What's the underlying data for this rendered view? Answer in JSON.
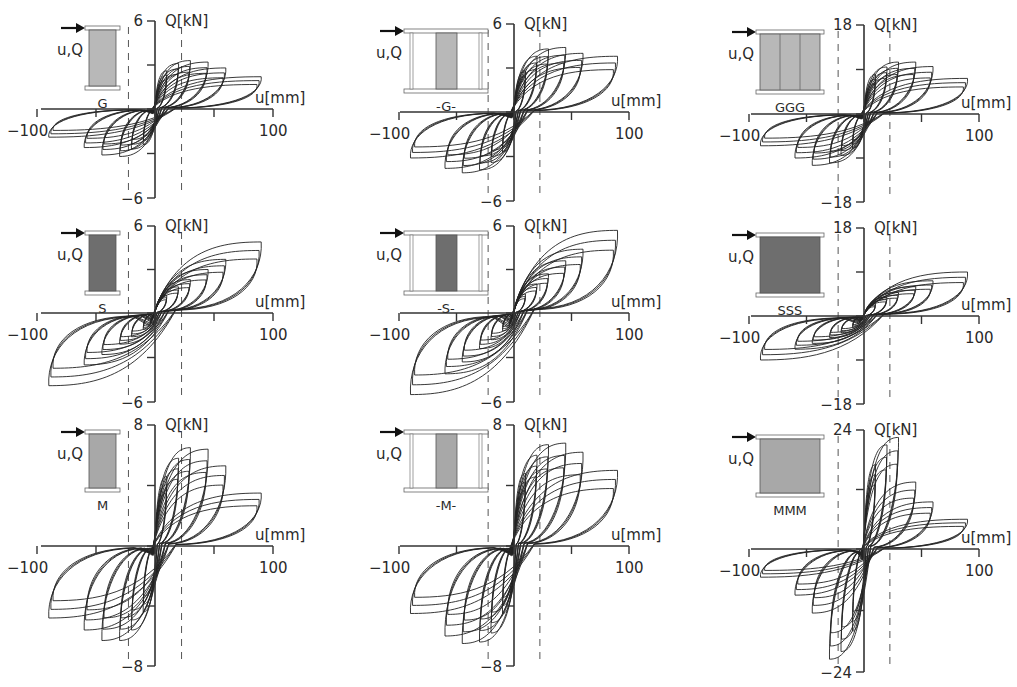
{
  "figure": {
    "caption": "",
    "axis_x_label": "u[mm]",
    "axis_y_label": "Q[kN]",
    "load_label": "u,Q"
  },
  "chart_data": [
    {
      "type": "line",
      "id": "G",
      "title": "G",
      "xlabel": "u[mm]",
      "ylabel": "Q[kN]",
      "xlim": [
        -100,
        100
      ],
      "ylim": [
        -6,
        6
      ],
      "xticks": [
        -100,
        -50,
        0,
        50,
        100
      ],
      "xtick_labels": [
        "-100",
        "",
        "",
        "",
        "100"
      ],
      "yticks": [
        -6,
        -3,
        0,
        3,
        6
      ],
      "ytick_labels": [
        "-6",
        "",
        "",
        "",
        "6"
      ],
      "reference_lines_u": [
        -22.5,
        22.5
      ],
      "specimen": "single",
      "fill": "#b8b8b8",
      "grid": false,
      "peaks": [
        {
          "u": 10,
          "q_pos": 2.6,
          "q_neg": -2.4
        },
        {
          "u": 20,
          "q_pos": 3.1,
          "q_neg": -2.7
        },
        {
          "u": 30,
          "q_pos": 3.3,
          "q_neg": -3.2
        },
        {
          "u": 45,
          "q_pos": 3.2,
          "q_neg": -3.1
        },
        {
          "u": 60,
          "q_pos": 2.8,
          "q_neg": -2.6
        },
        {
          "u": 90,
          "q_pos": 2.2,
          "q_neg": -1.9
        }
      ]
    },
    {
      "type": "line",
      "id": "-G-",
      "title": "-G-",
      "xlabel": "u[mm]",
      "ylabel": "Q[kN]",
      "xlim": [
        -100,
        100
      ],
      "ylim": [
        -6,
        6
      ],
      "xticks": [
        -100,
        -50,
        0,
        50,
        100
      ],
      "xtick_labels": [
        "-100",
        "",
        "",
        "",
        "100"
      ],
      "yticks": [
        -6,
        -3,
        0,
        3,
        6
      ],
      "ytick_labels": [
        "-6",
        "",
        "",
        "",
        "6"
      ],
      "reference_lines_u": [
        -22.5,
        22.5
      ],
      "specimen": "framed",
      "fill": "#b8b8b8",
      "grid": false,
      "peaks": [
        {
          "u": 10,
          "q_pos": 2.8,
          "q_neg": -2.7
        },
        {
          "u": 20,
          "q_pos": 3.8,
          "q_neg": -3.4
        },
        {
          "u": 30,
          "q_pos": 4.3,
          "q_neg": -3.9
        },
        {
          "u": 45,
          "q_pos": 4.4,
          "q_neg": -4.1
        },
        {
          "u": 60,
          "q_pos": 4.0,
          "q_neg": -3.8
        },
        {
          "u": 90,
          "q_pos": 3.8,
          "q_neg": -3.1
        }
      ]
    },
    {
      "type": "line",
      "id": "GGG",
      "title": "GGG",
      "xlabel": "u[mm]",
      "ylabel": "Q[kN]",
      "xlim": [
        -100,
        100
      ],
      "ylim": [
        -18,
        18
      ],
      "xticks": [
        -100,
        -50,
        0,
        50,
        100
      ],
      "xtick_labels": [
        "-100",
        "",
        "",
        "",
        "100"
      ],
      "yticks": [
        -18,
        -9,
        0,
        9,
        18
      ],
      "ytick_labels": [
        "-18",
        "",
        "",
        "",
        "18"
      ],
      "reference_lines_u": [
        -22.5,
        22.5
      ],
      "specimen": "triple",
      "fill": "#b8b8b8",
      "grid": false,
      "peaks": [
        {
          "u": 10,
          "q_pos": 8.0,
          "q_neg": -7.0
        },
        {
          "u": 20,
          "q_pos": 9.5,
          "q_neg": -8.5
        },
        {
          "u": 30,
          "q_pos": 10.5,
          "q_neg": -10.0
        },
        {
          "u": 45,
          "q_pos": 10.5,
          "q_neg": -10.5
        },
        {
          "u": 60,
          "q_pos": 9.6,
          "q_neg": -9.0
        },
        {
          "u": 90,
          "q_pos": 7.2,
          "q_neg": -6.5
        }
      ]
    },
    {
      "type": "line",
      "id": "S",
      "title": "S",
      "xlabel": "u[mm]",
      "ylabel": "Q[kN]",
      "xlim": [
        -100,
        100
      ],
      "ylim": [
        -6,
        6
      ],
      "xticks": [
        -100,
        -50,
        0,
        50,
        100
      ],
      "xtick_labels": [
        "-100",
        "",
        "",
        "",
        "100"
      ],
      "yticks": [
        -6,
        -3,
        0,
        3,
        6
      ],
      "ytick_labels": [
        "-6",
        "",
        "",
        "",
        "6"
      ],
      "reference_lines_u": [
        -22.5,
        22.5
      ],
      "specimen": "single",
      "fill": "#6e6e6e",
      "grid": false,
      "peaks": [
        {
          "u": 10,
          "q_pos": 1.2,
          "q_neg": -1.1
        },
        {
          "u": 20,
          "q_pos": 1.8,
          "q_neg": -1.6
        },
        {
          "u": 30,
          "q_pos": 2.3,
          "q_neg": -2.1
        },
        {
          "u": 45,
          "q_pos": 3.0,
          "q_neg": -2.8
        },
        {
          "u": 60,
          "q_pos": 3.7,
          "q_neg": -3.5
        },
        {
          "u": 90,
          "q_pos": 4.9,
          "q_neg": -4.9
        }
      ]
    },
    {
      "type": "line",
      "id": "-S-",
      "title": "-S-",
      "xlabel": "u[mm]",
      "ylabel": "Q[kN]",
      "xlim": [
        -100,
        100
      ],
      "ylim": [
        -6,
        6
      ],
      "xticks": [
        -100,
        -50,
        0,
        50,
        100
      ],
      "xtick_labels": [
        "-100",
        "",
        "",
        "",
        "100"
      ],
      "yticks": [
        -6,
        -3,
        0,
        3,
        6
      ],
      "ytick_labels": [
        "-6",
        "",
        "",
        "",
        "6"
      ],
      "reference_lines_u": [
        -22.5,
        22.5
      ],
      "specimen": "framed",
      "fill": "#6e6e6e",
      "grid": false,
      "peaks": [
        {
          "u": 10,
          "q_pos": 1.3,
          "q_neg": -1.2
        },
        {
          "u": 20,
          "q_pos": 2.0,
          "q_neg": -1.8
        },
        {
          "u": 30,
          "q_pos": 2.7,
          "q_neg": -2.4
        },
        {
          "u": 45,
          "q_pos": 3.6,
          "q_neg": -3.3
        },
        {
          "u": 60,
          "q_pos": 4.4,
          "q_neg": -4.1
        },
        {
          "u": 90,
          "q_pos": 5.7,
          "q_neg": -5.5
        }
      ]
    },
    {
      "type": "line",
      "id": "SSS",
      "title": "SSS",
      "xlabel": "u[mm]",
      "ylabel": "Q[kN]",
      "xlim": [
        -100,
        100
      ],
      "ylim": [
        -18,
        18
      ],
      "xticks": [
        -100,
        -50,
        0,
        50,
        100
      ],
      "xtick_labels": [
        "-100",
        "",
        "",
        "",
        "100"
      ],
      "yticks": [
        -18,
        -9,
        0,
        9,
        18
      ],
      "ytick_labels": [
        "-18",
        "",
        "",
        "",
        "18"
      ],
      "reference_lines_u": [
        -22.5,
        22.5
      ],
      "specimen": "triple-solid",
      "fill": "#6e6e6e",
      "grid": false,
      "peaks": [
        {
          "u": 10,
          "q_pos": 2.5,
          "q_neg": -2.3
        },
        {
          "u": 20,
          "q_pos": 3.8,
          "q_neg": -3.4
        },
        {
          "u": 30,
          "q_pos": 4.8,
          "q_neg": -4.4
        },
        {
          "u": 45,
          "q_pos": 6.0,
          "q_neg": -5.6
        },
        {
          "u": 60,
          "q_pos": 7.2,
          "q_neg": -6.8
        },
        {
          "u": 90,
          "q_pos": 9.0,
          "q_neg": -9.0
        }
      ]
    },
    {
      "type": "line",
      "id": "M",
      "title": "M",
      "xlabel": "u[mm]",
      "ylabel": "Q[kN]",
      "xlim": [
        -100,
        100
      ],
      "ylim": [
        -8,
        8
      ],
      "xticks": [
        -100,
        -50,
        0,
        50,
        100
      ],
      "xtick_labels": [
        "-100",
        "",
        "",
        "",
        "100"
      ],
      "yticks": [
        -8,
        -4,
        0,
        4,
        8
      ],
      "ytick_labels": [
        "-8",
        "",
        "",
        "",
        "8"
      ],
      "reference_lines_u": [
        -22.5,
        22.5
      ],
      "specimen": "single",
      "fill": "#a8a8a8",
      "grid": false,
      "peaks": [
        {
          "u": 10,
          "q_pos": 4.6,
          "q_neg": -4.4
        },
        {
          "u": 20,
          "q_pos": 5.8,
          "q_neg": -5.6
        },
        {
          "u": 30,
          "q_pos": 6.5,
          "q_neg": -6.3
        },
        {
          "u": 45,
          "q_pos": 6.4,
          "q_neg": -6.3
        },
        {
          "u": 60,
          "q_pos": 5.3,
          "q_neg": -5.6
        },
        {
          "u": 90,
          "q_pos": 3.5,
          "q_neg": -4.8
        }
      ]
    },
    {
      "type": "line",
      "id": "-M-",
      "title": "-M-",
      "xlabel": "u[mm]",
      "ylabel": "Q[kN]",
      "xlim": [
        -100,
        100
      ],
      "ylim": [
        -8,
        8
      ],
      "xticks": [
        -100,
        -50,
        0,
        50,
        100
      ],
      "xtick_labels": [
        "-100",
        "",
        "",
        "",
        "100"
      ],
      "yticks": [
        -8,
        -4,
        0,
        4,
        8
      ],
      "ytick_labels": [
        "-8",
        "",
        "",
        "",
        "8"
      ],
      "reference_lines_u": [
        -22.5,
        22.5
      ],
      "specimen": "framed",
      "fill": "#a8a8a8",
      "grid": false,
      "peaks": [
        {
          "u": 10,
          "q_pos": 4.8,
          "q_neg": -4.5
        },
        {
          "u": 20,
          "q_pos": 6.0,
          "q_neg": -5.8
        },
        {
          "u": 30,
          "q_pos": 6.7,
          "q_neg": -6.4
        },
        {
          "u": 45,
          "q_pos": 6.8,
          "q_neg": -6.5
        },
        {
          "u": 60,
          "q_pos": 6.2,
          "q_neg": -6.0
        },
        {
          "u": 90,
          "q_pos": 5.0,
          "q_neg": -4.5
        }
      ]
    },
    {
      "type": "line",
      "id": "MMM",
      "title": "MMM",
      "xlabel": "u[mm]",
      "ylabel": "Q[kN]",
      "xlim": [
        -100,
        100
      ],
      "ylim": [
        -24,
        24
      ],
      "xticks": [
        -100,
        -50,
        0,
        50,
        100
      ],
      "xtick_labels": [
        "-100",
        "",
        "",
        "",
        "100"
      ],
      "yticks": [
        -24,
        -12,
        0,
        12,
        24
      ],
      "ytick_labels": [
        "-24",
        "",
        "",
        "",
        "24"
      ],
      "reference_lines_u": [
        -22.5,
        22.5
      ],
      "specimen": "triple-solid",
      "fill": "#a8a8a8",
      "grid": false,
      "peaks": [
        {
          "u": 10,
          "q_pos": 17.0,
          "q_neg": -16.0
        },
        {
          "u": 20,
          "q_pos": 21.0,
          "q_neg": -20.0
        },
        {
          "u": 30,
          "q_pos": 22.5,
          "q_neg": -21.5
        },
        {
          "u": 45,
          "q_pos": 13.5,
          "q_neg": -12.5
        },
        {
          "u": 60,
          "q_pos": 9.5,
          "q_neg": -9.0
        },
        {
          "u": 90,
          "q_pos": 6.0,
          "q_neg": -5.5
        }
      ]
    }
  ],
  "layout": {
    "panels": [
      {
        "ox": 155,
        "x_axis_y": 109,
        "y_top": 21,
        "y_bot": 198,
        "x_left": 41,
        "x_right": 273
      },
      {
        "ox": 514,
        "x_axis_y": 112,
        "y_top": 24,
        "y_bot": 201,
        "x_left": 400,
        "x_right": 629
      },
      {
        "ox": 864,
        "x_axis_y": 114,
        "y_top": 25,
        "y_bot": 202,
        "x_left": 751,
        "x_right": 979
      },
      {
        "ox": 155,
        "x_axis_y": 313,
        "y_top": 226,
        "y_bot": 402,
        "x_left": 41,
        "x_right": 273
      },
      {
        "ox": 514,
        "x_axis_y": 313,
        "y_top": 226,
        "y_bot": 402,
        "x_left": 400,
        "x_right": 629
      },
      {
        "ox": 864,
        "x_axis_y": 316,
        "y_top": 228,
        "y_bot": 404,
        "x_left": 751,
        "x_right": 979
      },
      {
        "ox": 155,
        "x_axis_y": 546,
        "y_top": 425,
        "y_bot": 666,
        "x_left": 41,
        "x_right": 273
      },
      {
        "ox": 514,
        "x_axis_y": 546,
        "y_top": 425,
        "y_bot": 666,
        "x_left": 400,
        "x_right": 629
      },
      {
        "ox": 864,
        "x_axis_y": 549,
        "y_top": 430,
        "y_bot": 672,
        "x_left": 751,
        "x_right": 979
      }
    ]
  }
}
